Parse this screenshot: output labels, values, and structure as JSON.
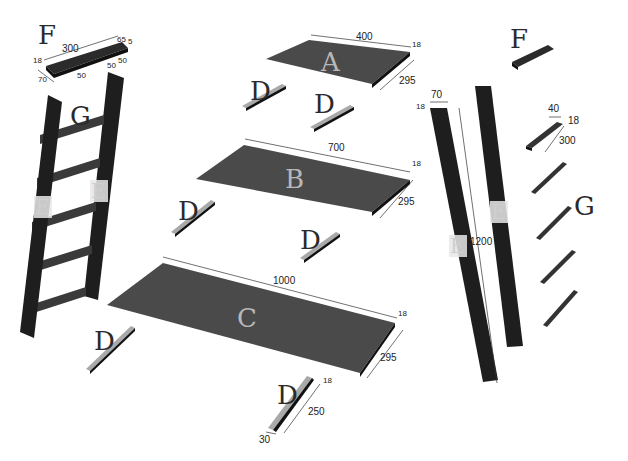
{
  "diagram": {
    "type": "exploded-parts-diagram",
    "colors": {
      "panel": "#4a4a4a",
      "panel_edge": "#111111",
      "rail": "#1e1e1e",
      "cleat_top": "#a9a9a9",
      "label_dark": "#2a2a2a",
      "label_light": "#b8b8b8"
    },
    "parts": {
      "A": {
        "label": "A",
        "length": "400",
        "width": "295",
        "thickness": "18"
      },
      "B": {
        "label": "B",
        "length": "700",
        "width": "295",
        "thickness": "18"
      },
      "C": {
        "label": "C",
        "length": "1000",
        "width": "295",
        "thickness": "18"
      },
      "D": {
        "label": "D",
        "length": "250",
        "width": "30",
        "thickness": "18"
      },
      "E": {
        "label": "E",
        "length": "1200",
        "width": "70",
        "thickness": "18"
      },
      "F": {
        "label": "F",
        "length": "300",
        "width": "70",
        "thickness": "18",
        "notch_a": "65",
        "notch_b": "5",
        "notch_c": "50",
        "notch_d": "50",
        "notch_e": "50"
      },
      "G": {
        "label": "G",
        "length": "300",
        "width": "40",
        "thickness": "18"
      }
    }
  }
}
